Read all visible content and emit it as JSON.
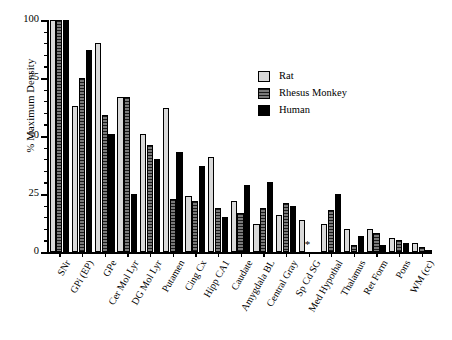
{
  "chart_data": {
    "type": "bar",
    "title": "",
    "xlabel": "",
    "ylabel": "% Maximum Density",
    "ylim": [
      0,
      100
    ],
    "yticks": [
      0,
      25,
      50,
      75,
      100
    ],
    "ytick_labels": [
      "0",
      "25",
      "50",
      "75",
      "100"
    ],
    "minor_ticks": true,
    "grid": false,
    "legend_position": "upper-right-inside",
    "categories": [
      "SNr",
      "GPi (EP)",
      "GPe",
      "Cer Mol Lyr",
      "DG Mol Lyr",
      "Putamen",
      "Cing Cx",
      "Hipp CA1",
      "Caudate",
      "Amygdala BL",
      "Central Gray",
      "Sp Cd SG",
      "Med Hypothal",
      "Thalamus",
      "Ret Form",
      "Pons",
      "WM (cc)"
    ],
    "series": [
      {
        "name": "Rat",
        "color": "#d9d9d9",
        "values": [
          100,
          63,
          90,
          67,
          51,
          62,
          24,
          41,
          22,
          12,
          16,
          14,
          12,
          10,
          10,
          6,
          4
        ]
      },
      {
        "name": "Rhesus Monkey",
        "color": "#616161",
        "values": [
          100,
          75,
          59,
          67,
          46,
          23,
          22,
          19,
          17,
          19,
          21,
          null,
          18,
          3,
          8,
          5,
          2
        ]
      },
      {
        "name": "Human",
        "color": "#000000",
        "values": [
          100,
          87,
          51,
          25,
          40,
          43,
          37,
          15,
          29,
          30,
          20,
          null,
          25,
          7,
          3,
          4,
          1
        ]
      }
    ],
    "annotations": [
      {
        "category": "Sp Cd SG",
        "symbol": "*",
        "meaning": "data not available"
      }
    ]
  },
  "legend": {
    "items": [
      {
        "label": "Rat",
        "swatch": "light-gray"
      },
      {
        "label": "Rhesus Monkey",
        "swatch": "dark-gray-hatched"
      },
      {
        "label": "Human",
        "swatch": "black"
      }
    ]
  }
}
